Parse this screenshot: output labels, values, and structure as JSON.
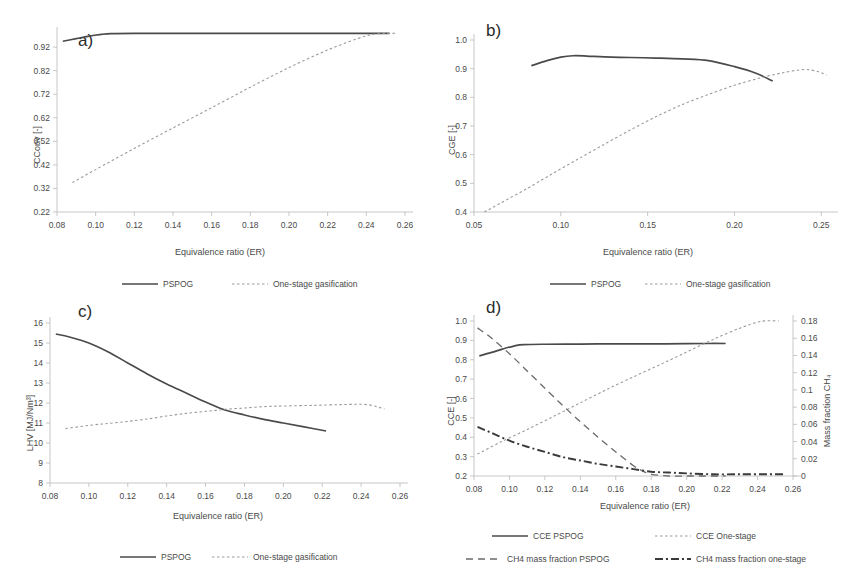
{
  "figure": {
    "panels": [
      "a)",
      "b)",
      "c)",
      "d)"
    ]
  },
  "labels": {
    "panel_a": "a)",
    "panel_b": "b)",
    "panel_c": "c)",
    "panel_d": "d)",
    "xlabel": "Equivalence ratio (ER)",
    "ylabel_a": "CConv [-]",
    "ylabel_b": "CGE [-]",
    "ylabel_c": "LHV [MJ/Nm³]",
    "ylabel_d": "CCE [-]",
    "ylabel_d_right": "Mass fraction CH₄",
    "legend_pspog": "PSPOG",
    "legend_onestage": "One-stage gasification",
    "legend_cce_pspog": "CCE PSPOG",
    "legend_cce_onestage": "CCE One-stage",
    "legend_ch4_pspog": "CH4 mass fraction PSPOG",
    "legend_ch4_onestage": "CH4 mass fraction one-stage"
  },
  "colors": {
    "solid": "#4a4a4a",
    "dotted": "#9a9a9a",
    "dashed": "#6a6a6a",
    "dashdot": "#3a3a3a",
    "axis": "#b9b9b9",
    "text": "#4a4a4a"
  },
  "chart_data": [
    {
      "id": "a",
      "type": "line",
      "title": "a)",
      "xlabel": "Equivalence ratio (ER)",
      "ylabel": "CConv [-]",
      "xlim": [
        0.08,
        0.26
      ],
      "ylim": [
        0.22,
        0.98
      ],
      "xticks": [
        0.08,
        0.1,
        0.12,
        0.14,
        0.16,
        0.18,
        0.2,
        0.22,
        0.24,
        0.26
      ],
      "xtick_labels": [
        "0.08",
        "0.10",
        "0.12",
        "0.14",
        "0.16",
        "0.18",
        "0.20",
        "0.22",
        "0.24",
        "0.26"
      ],
      "yticks": [
        0.22,
        0.32,
        0.42,
        0.52,
        0.62,
        0.72,
        0.82,
        0.92
      ],
      "ytick_labels": [
        "0.22",
        "0.32",
        "0.42",
        "0.52",
        "0.62",
        "0.72",
        "0.82",
        "0.92"
      ],
      "grid": false,
      "legend_position": "below",
      "series": [
        {
          "name": "PSPOG",
          "style": "solid",
          "x": [
            0.083,
            0.09,
            0.096,
            0.103,
            0.108,
            0.12,
            0.14,
            0.16,
            0.18,
            0.2,
            0.22,
            0.24,
            0.252
          ],
          "y": [
            0.945,
            0.956,
            0.966,
            0.974,
            0.977,
            0.978,
            0.978,
            0.978,
            0.978,
            0.978,
            0.978,
            0.978,
            0.978
          ]
        },
        {
          "name": "One-stage gasification",
          "style": "dotted",
          "x": [
            0.088,
            0.1,
            0.12,
            0.14,
            0.16,
            0.18,
            0.2,
            0.22,
            0.24,
            0.25,
            0.256
          ],
          "y": [
            0.345,
            0.4,
            0.49,
            0.577,
            0.663,
            0.75,
            0.833,
            0.908,
            0.968,
            0.978,
            0.978
          ]
        }
      ]
    },
    {
      "id": "b",
      "type": "line",
      "title": "b)",
      "xlabel": "Equivalence ratio (ER)",
      "ylabel": "CGE [-]",
      "xlim": [
        0.05,
        0.255
      ],
      "ylim": [
        0.4,
        1.0
      ],
      "xticks": [
        0.05,
        0.1,
        0.15,
        0.2,
        0.25
      ],
      "xtick_labels": [
        "0.05",
        "0.10",
        "0.15",
        "0.20",
        "0.25"
      ],
      "yticks": [
        0.4,
        0.5,
        0.6,
        0.7,
        0.8,
        0.9,
        1.0
      ],
      "ytick_labels": [
        "0.4",
        "0.5",
        "0.6",
        "0.7",
        "0.8",
        "0.9",
        "1.0"
      ],
      "grid": false,
      "legend_position": "below",
      "series": [
        {
          "name": "PSPOG",
          "style": "solid",
          "x": [
            0.083,
            0.092,
            0.1,
            0.107,
            0.115,
            0.125,
            0.14,
            0.155,
            0.17,
            0.185,
            0.2,
            0.212,
            0.222
          ],
          "y": [
            0.91,
            0.928,
            0.94,
            0.945,
            0.944,
            0.941,
            0.939,
            0.937,
            0.934,
            0.928,
            0.907,
            0.885,
            0.857
          ]
        },
        {
          "name": "One-stage gasification",
          "style": "dotted",
          "x": [
            0.056,
            0.065,
            0.08,
            0.095,
            0.11,
            0.125,
            0.14,
            0.155,
            0.17,
            0.185,
            0.2,
            0.215,
            0.228,
            0.24,
            0.248,
            0.253
          ],
          "y": [
            0.4,
            0.43,
            0.48,
            0.533,
            0.585,
            0.636,
            0.686,
            0.733,
            0.775,
            0.81,
            0.842,
            0.868,
            0.886,
            0.897,
            0.89,
            0.877
          ]
        }
      ]
    },
    {
      "id": "c",
      "type": "line",
      "title": "c)",
      "xlabel": "Equivalence ratio (ER)",
      "ylabel": "LHV [MJ/Nm³]",
      "xlim": [
        0.08,
        0.26
      ],
      "ylim": [
        8,
        16
      ],
      "xticks": [
        0.08,
        0.1,
        0.12,
        0.14,
        0.16,
        0.18,
        0.2,
        0.22,
        0.24,
        0.26
      ],
      "xtick_labels": [
        "0.08",
        "0.10",
        "0.12",
        "0.14",
        "0.16",
        "0.18",
        "0.20",
        "0.22",
        "0.24",
        "0.26"
      ],
      "yticks": [
        8,
        9,
        10,
        11,
        12,
        13,
        14,
        15,
        16
      ],
      "ytick_labels": [
        "8",
        "9",
        "10",
        "11",
        "12",
        "13",
        "14",
        "15",
        "16"
      ],
      "grid": false,
      "legend_position": "below",
      "series": [
        {
          "name": "PSPOG",
          "style": "solid",
          "x": [
            0.083,
            0.09,
            0.1,
            0.11,
            0.12,
            0.13,
            0.14,
            0.15,
            0.16,
            0.17,
            0.18,
            0.19,
            0.2,
            0.21,
            0.222
          ],
          "y": [
            15.45,
            15.3,
            15.0,
            14.55,
            14.0,
            13.45,
            12.95,
            12.5,
            12.05,
            11.65,
            11.4,
            11.18,
            11.0,
            10.82,
            10.6
          ]
        },
        {
          "name": "One-stage gasification",
          "style": "dotted",
          "x": [
            0.088,
            0.1,
            0.11,
            0.12,
            0.13,
            0.14,
            0.15,
            0.16,
            0.17,
            0.18,
            0.19,
            0.2,
            0.215,
            0.23,
            0.243,
            0.252
          ],
          "y": [
            10.72,
            10.88,
            10.98,
            11.08,
            11.2,
            11.35,
            11.48,
            11.58,
            11.68,
            11.75,
            11.82,
            11.85,
            11.88,
            11.92,
            11.92,
            11.7
          ]
        }
      ]
    },
    {
      "id": "d",
      "type": "line",
      "title": "d)",
      "xlabel": "Equivalence ratio (ER)",
      "ylabel": "CCE [-]",
      "ylabel_right": "Mass fraction CH₄",
      "xlim": [
        0.08,
        0.26
      ],
      "ylim": [
        0.2,
        1.0
      ],
      "ylim_right": [
        0,
        0.18
      ],
      "xticks": [
        0.08,
        0.1,
        0.12,
        0.14,
        0.16,
        0.18,
        0.2,
        0.22,
        0.24,
        0.26
      ],
      "xtick_labels": [
        "0.08",
        "0.10",
        "0.12",
        "0.14",
        "0.16",
        "0.18",
        "0.20",
        "0.22",
        "0.24",
        "0.26"
      ],
      "yticks": [
        0.2,
        0.3,
        0.4,
        0.5,
        0.6,
        0.7,
        0.8,
        0.9,
        1.0
      ],
      "ytick_labels": [
        "0.2",
        "0.3",
        "0.4",
        "0.5",
        "0.6",
        "0.7",
        "0.8",
        "0.9",
        "1.0"
      ],
      "yticks_right": [
        0,
        0.02,
        0.04,
        0.06,
        0.08,
        0.1,
        0.12,
        0.14,
        0.16,
        0.18
      ],
      "ytick_labels_right": [
        "0",
        "0.02",
        "0.04",
        "0.06",
        "0.08",
        "0.1",
        "0.12",
        "0.14",
        "0.16",
        "0.18"
      ],
      "grid": false,
      "legend_position": "below",
      "series": [
        {
          "name": "CCE PSPOG",
          "style": "solid",
          "axis": "left",
          "x": [
            0.083,
            0.09,
            0.096,
            0.103,
            0.108,
            0.12,
            0.14,
            0.16,
            0.18,
            0.2,
            0.212,
            0.222
          ],
          "y": [
            0.82,
            0.838,
            0.855,
            0.872,
            0.878,
            0.88,
            0.881,
            0.882,
            0.882,
            0.883,
            0.884,
            0.884
          ]
        },
        {
          "name": "CCE One-stage",
          "style": "dotted",
          "axis": "left",
          "x": [
            0.082,
            0.095,
            0.11,
            0.125,
            0.14,
            0.155,
            0.17,
            0.185,
            0.2,
            0.215,
            0.23,
            0.242,
            0.252
          ],
          "y": [
            0.313,
            0.375,
            0.44,
            0.508,
            0.578,
            0.647,
            0.712,
            0.775,
            0.84,
            0.905,
            0.963,
            0.998,
            1.0
          ]
        },
        {
          "name": "CH4 mass fraction PSPOG",
          "style": "dashed",
          "axis": "right",
          "x": [
            0.082,
            0.09,
            0.1,
            0.11,
            0.12,
            0.13,
            0.14,
            0.15,
            0.16,
            0.17,
            0.175,
            0.18,
            0.19,
            0.2,
            0.21,
            0.222
          ],
          "y": [
            0.172,
            0.16,
            0.142,
            0.122,
            0.102,
            0.082,
            0.063,
            0.045,
            0.028,
            0.012,
            0.006,
            0.002,
            0.0,
            0.0,
            0.0,
            0.0
          ]
        },
        {
          "name": "CH4 mass fraction one-stage",
          "style": "dashdot",
          "axis": "right",
          "x": [
            0.082,
            0.09,
            0.1,
            0.11,
            0.12,
            0.13,
            0.14,
            0.15,
            0.16,
            0.17,
            0.18,
            0.19,
            0.2,
            0.215,
            0.23,
            0.245,
            0.256
          ],
          "y": [
            0.057,
            0.05,
            0.041,
            0.034,
            0.028,
            0.022,
            0.018,
            0.014,
            0.011,
            0.008,
            0.005,
            0.004,
            0.003,
            0.002,
            0.002,
            0.002,
            0.002
          ]
        }
      ]
    }
  ]
}
